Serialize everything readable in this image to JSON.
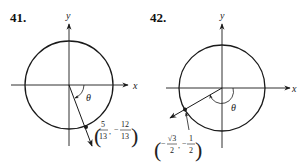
{
  "figures": [
    {
      "number": "41.",
      "x_label": "x",
      "y_label": "y",
      "angle_label": "θ",
      "point": {
        "x_num": "5",
        "x_den": "13",
        "x_sign": "",
        "y_num": "12",
        "y_den": "13",
        "y_sign": "−",
        "comma": ","
      }
    },
    {
      "number": "42.",
      "x_label": "x",
      "y_label": "y",
      "angle_label": "θ",
      "point": {
        "x_num": "√3",
        "x_den": "2",
        "x_sign": "−",
        "y_num": "1",
        "y_den": "2",
        "y_sign": "−",
        "comma": ","
      }
    }
  ],
  "colors": {
    "ink": "#1a1a1a",
    "background": "#ffffff"
  }
}
